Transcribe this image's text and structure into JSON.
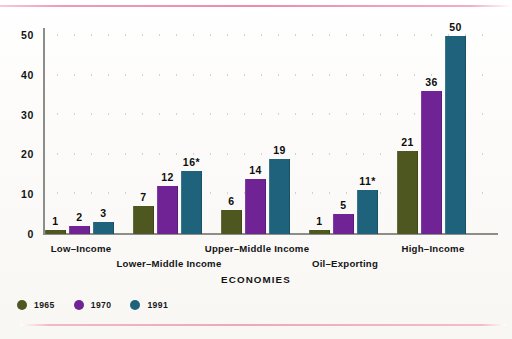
{
  "figure": {
    "x_axis_title": "ECONOMIES"
  },
  "legend": {
    "items": [
      {
        "label": "1965",
        "color": "#4e571f",
        "icon": "legend-dot-icon"
      },
      {
        "label": "1970",
        "color": "#6f2394",
        "icon": "legend-dot-icon"
      },
      {
        "label": "1991",
        "color": "#1f627b",
        "icon": "legend-dot-icon"
      }
    ]
  },
  "chart_data": {
    "type": "bar",
    "title": "",
    "xlabel": "ECONOMIES",
    "ylabel": "",
    "ylim": [
      0,
      52
    ],
    "yticks": [
      0,
      10,
      20,
      30,
      40,
      50
    ],
    "ytick_labels": [
      "0",
      "10",
      "20",
      "30",
      "40",
      "50"
    ],
    "grid": "dotted-horizontal",
    "legend_position": "bottom-left",
    "categories": [
      "Low-Income",
      "Lower-Middle Income",
      "Upper-Middle Income",
      "Oil-Exporting",
      "High-Income"
    ],
    "series": [
      {
        "name": "1965",
        "color": "#4e571f",
        "values": [
          1,
          7,
          6,
          1,
          21
        ],
        "data_labels": [
          "1",
          "7",
          "6",
          "1",
          "21"
        ]
      },
      {
        "name": "1970",
        "color": "#6f2394",
        "values": [
          2,
          12,
          14,
          5,
          36
        ],
        "data_labels": [
          "2",
          "12",
          "14",
          "5",
          "36"
        ]
      },
      {
        "name": "1991",
        "color": "#1f627b",
        "values": [
          3,
          16,
          19,
          11,
          50
        ],
        "data_labels": [
          "3",
          "16*",
          "19",
          "11*",
          "50"
        ]
      }
    ],
    "annotations": [
      "* asterisk marks 1991 values for Lower-Middle Income (16*) and Oil-Exporting (11*)"
    ]
  }
}
